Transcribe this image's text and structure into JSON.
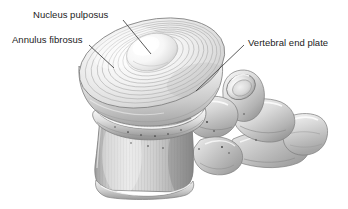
{
  "figure": {
    "kind": "anatomical-illustration",
    "style": "grayscale airbrush medical illustration",
    "background_color": "#ffffff",
    "label_text_color": "#1b1b1b",
    "leader_line_color": "#3c3c3c",
    "annotations": [
      {
        "id": "nucleus-pulposus",
        "label": "Nucleus pulposus",
        "label_x": 33,
        "label_y": 9,
        "leader": {
          "x1": 123,
          "y1": 20,
          "x2": 151,
          "y2": 54
        }
      },
      {
        "id": "annulus-fibrosus",
        "label": "Annulus fibrosus",
        "label_x": 12,
        "label_y": 34,
        "leader": {
          "x1": 89,
          "y1": 45,
          "x2": 114,
          "y2": 68
        }
      },
      {
        "id": "vertebral-end-plate",
        "label": "Vertebral end plate",
        "label_x": 248,
        "label_y": 37,
        "leader": {
          "x1": 244,
          "y1": 45,
          "x2": 196,
          "y2": 91
        }
      }
    ],
    "structures": [
      {
        "id": "nucleus-pulposus",
        "name": "Nucleus pulposus",
        "tone": "#fdfdfd"
      },
      {
        "id": "annulus-fibrosus",
        "name": "Annulus fibrosus lamellae",
        "tone": "#d6d6d6"
      },
      {
        "id": "disc-body",
        "name": "Intervertebral disc body",
        "tone": "#e4e4e4"
      },
      {
        "id": "vertebral-end-plate",
        "name": "Vertebral end plate",
        "tone": "#c9c9c9"
      },
      {
        "id": "vertebral-body",
        "name": "Vertebral body",
        "tone": "#c2c2c2"
      },
      {
        "id": "pedicle",
        "name": "Pedicle",
        "tone": "#b4b4b4"
      },
      {
        "id": "superior-articular-process",
        "name": "Superior articular process",
        "tone": "#d2d2d2"
      },
      {
        "id": "transverse-process",
        "name": "Transverse process",
        "tone": "#c8c8c8"
      },
      {
        "id": "spinous-process",
        "name": "Spinous process",
        "tone": "#cccccc"
      }
    ],
    "palette": {
      "highlight": "#ffffff",
      "light": "#ededed",
      "mid": "#c4c4c4",
      "shade": "#9a9a9a",
      "deep_shade": "#777777",
      "outline": "#6d6d6d",
      "foramen_dot": "#3a3a3a"
    }
  }
}
